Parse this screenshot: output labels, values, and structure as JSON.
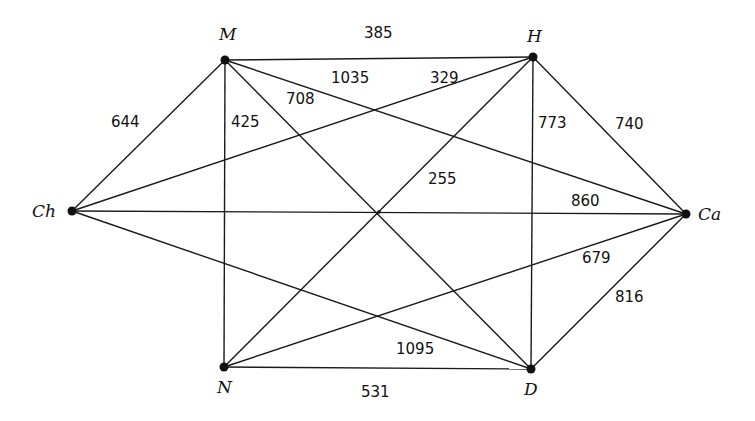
{
  "graph": {
    "nodes": [
      {
        "id": "M",
        "label": "M",
        "x": 225,
        "y": 60,
        "lx": 219,
        "ly": 40
      },
      {
        "id": "H",
        "label": "H",
        "x": 533,
        "y": 57,
        "lx": 527,
        "ly": 42
      },
      {
        "id": "Ch",
        "label": "Ch",
        "x": 72,
        "y": 211,
        "lx": 32,
        "ly": 217
      },
      {
        "id": "Ca",
        "label": "Ca",
        "x": 686,
        "y": 214,
        "lx": 698,
        "ly": 220
      },
      {
        "id": "N",
        "label": "N",
        "x": 224,
        "y": 367,
        "lx": 217,
        "ly": 393
      },
      {
        "id": "D",
        "label": "D",
        "x": 531,
        "y": 369,
        "lx": 524,
        "ly": 395
      }
    ],
    "edges": [
      {
        "from": "M",
        "to": "H",
        "weight": "385",
        "lx": 364,
        "ly": 38
      },
      {
        "from": "M",
        "to": "Ca",
        "weight": "1035",
        "lx": 331,
        "ly": 83
      },
      {
        "from": "Ch",
        "to": "H",
        "weight": "329",
        "lx": 430,
        "ly": 83
      },
      {
        "from": "M",
        "to": "D",
        "weight": "708",
        "lx": 286,
        "ly": 104
      },
      {
        "from": "M",
        "to": "N",
        "weight": "425",
        "lx": 231,
        "ly": 127
      },
      {
        "from": "Ch",
        "to": "M",
        "weight": "644",
        "lx": 111,
        "ly": 127
      },
      {
        "from": "H",
        "to": "D",
        "weight": "773",
        "lx": 538,
        "ly": 128
      },
      {
        "from": "H",
        "to": "Ca",
        "weight": "740",
        "lx": 615,
        "ly": 129
      },
      {
        "from": "N",
        "to": "H",
        "weight": "255",
        "lx": 428,
        "ly": 184
      },
      {
        "from": "Ch",
        "to": "Ca",
        "weight": "860",
        "lx": 571,
        "ly": 206
      },
      {
        "from": "N",
        "to": "Ca",
        "weight": "679",
        "lx": 582,
        "ly": 263
      },
      {
        "from": "D",
        "to": "Ca",
        "weight": "816",
        "lx": 615,
        "ly": 302
      },
      {
        "from": "Ch",
        "to": "D",
        "weight": "1095",
        "lx": 396,
        "ly": 354
      },
      {
        "from": "N",
        "to": "D",
        "weight": "531",
        "lx": 361,
        "ly": 397
      }
    ]
  }
}
